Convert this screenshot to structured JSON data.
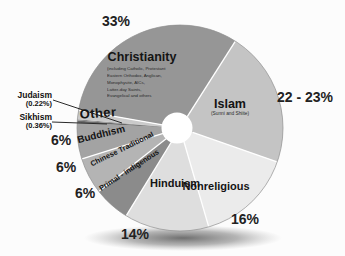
{
  "chart_data": {
    "type": "pie",
    "start_angle_deg": 170,
    "clockwise": true,
    "hole_radius_ratio": 0.15,
    "legend_position": "none",
    "slices": [
      {
        "name": "Christianity",
        "value": 33,
        "value_label": "33%",
        "color": "#969696",
        "sub": [
          "(including Catholic, Protestant",
          "Eastern Orthodox, Anglican,",
          "Monophysite, AICs,",
          "Latter-day Saints,",
          "Evangelical and others"
        ]
      },
      {
        "name": "Islam",
        "value": 22.5,
        "value_label": "22 - 23%",
        "color": "#c4c4c4",
        "sublabel": "(Sunni and Shiite)"
      },
      {
        "name": "Nonreligious",
        "value": 16,
        "value_label": "16%",
        "color": "#ebebeb"
      },
      {
        "name": "Hinduism",
        "value": 14,
        "value_label": "14%",
        "color": "#dedede"
      },
      {
        "name": "Primal - indigenous",
        "value": 6,
        "value_label": "6%",
        "color": "#8b8b8b"
      },
      {
        "name": "Chinese Traditional",
        "value": 6,
        "value_label": "6%",
        "color": "#b4b4b4"
      },
      {
        "name": "Buddhism",
        "value": 6,
        "value_label": "6%",
        "color": "#a3a3a3"
      },
      {
        "name": "Sikhism",
        "value": 0.36,
        "value_label": "(0.36%)",
        "color": "#6a6a6a"
      },
      {
        "name": "Judaism",
        "value": 0.22,
        "value_label": "(0.22%)",
        "color": "#8a8a8a"
      },
      {
        "name": "Other",
        "value": 1.5,
        "value_label": "",
        "color": "#cacaca"
      }
    ],
    "colors": {
      "separator": "#ffffff",
      "rim": "#8f8f8f",
      "hole": "#ffffff",
      "leader_line": "#2a2a2a",
      "shadow": "#4a4a4a"
    }
  }
}
